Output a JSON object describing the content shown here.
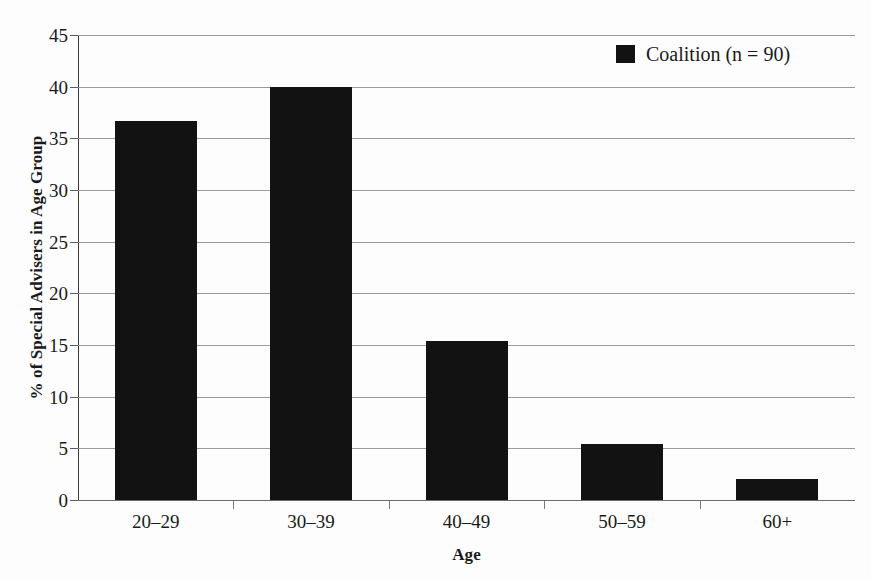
{
  "chart_data": {
    "type": "bar",
    "title": "",
    "categories": [
      "20–29",
      "30–39",
      "40–49",
      "50–59",
      "60+"
    ],
    "values": [
      36.7,
      40.0,
      15.4,
      5.4,
      2.0
    ],
    "series": [
      {
        "name": "Coalition (n = 90)",
        "values": [
          36.7,
          40.0,
          15.4,
          5.4,
          2.0
        ],
        "color": "#121212"
      }
    ],
    "xlabel": "Age",
    "ylabel": "% of Special Advisers in Age Group",
    "ylim": [
      0,
      45
    ],
    "ytick_step": 5,
    "yticks": [
      "45",
      "40",
      "35",
      "30",
      "25",
      "20",
      "15",
      "10",
      "5",
      "0"
    ],
    "ytick_values": [
      45,
      40,
      35,
      30,
      25,
      20,
      15,
      10,
      5,
      0
    ],
    "grid": true,
    "legend_position": "top-right",
    "legend_entries": [
      {
        "label": "Coalition (n = 90)",
        "color": "#121212",
        "marker": "square"
      }
    ],
    "colors": {
      "bar": "#121212",
      "gridline": "#9a9a9a",
      "axis": "#3a3a3a",
      "background": "#fdfdfd",
      "text": "#1a1a1a"
    }
  }
}
